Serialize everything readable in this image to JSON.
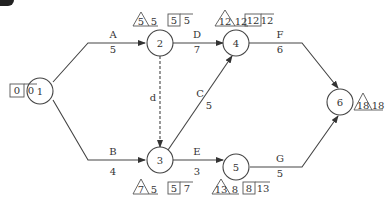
{
  "diagram": {
    "type": "activity-on-arrow network",
    "nodes": [
      {
        "id": "1",
        "label": "1",
        "et": "0",
        "lt": "0"
      },
      {
        "id": "2",
        "label": "2",
        "tri": "5",
        "tri_val": "5",
        "box_a": "5",
        "box_b": "5"
      },
      {
        "id": "3",
        "label": "3",
        "tri": "7",
        "tri_val": "5",
        "box_a": "5",
        "box_b": "7"
      },
      {
        "id": "4",
        "label": "4",
        "tri": "12",
        "tri_val": "12",
        "box_a": "12",
        "box_b": "12"
      },
      {
        "id": "5",
        "label": "5",
        "tri": "13",
        "tri_val": "8",
        "box_a": "8",
        "box_b": "13"
      },
      {
        "id": "6",
        "label": "6",
        "tri": "18",
        "tri_val": "18"
      }
    ],
    "activities": [
      {
        "name": "A",
        "duration": "5",
        "from": "1",
        "to": "2"
      },
      {
        "name": "B",
        "duration": "4",
        "from": "1",
        "to": "3"
      },
      {
        "name": "d",
        "duration": "",
        "from": "2",
        "to": "3",
        "dummy": true
      },
      {
        "name": "C",
        "duration": "5",
        "from": "3",
        "to": "4"
      },
      {
        "name": "D",
        "duration": "7",
        "from": "2",
        "to": "4"
      },
      {
        "name": "E",
        "duration": "3",
        "from": "3",
        "to": "5"
      },
      {
        "name": "F",
        "duration": "6",
        "from": "4",
        "to": "6"
      },
      {
        "name": "G",
        "duration": "5",
        "from": "5",
        "to": "6"
      }
    ]
  }
}
